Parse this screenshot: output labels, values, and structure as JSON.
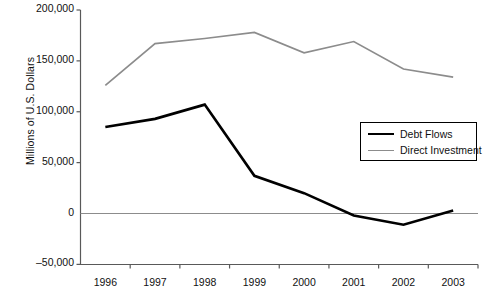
{
  "chart_data": {
    "type": "line",
    "title": "",
    "xlabel": "",
    "ylabel": "Millions of U.S. Dollars",
    "categories": [
      "1996",
      "1997",
      "1998",
      "1999",
      "2000",
      "2001",
      "2002",
      "2003"
    ],
    "ylim": [
      -50000,
      200000
    ],
    "yticks": [
      -50000,
      0,
      50000,
      100000,
      150000,
      200000
    ],
    "ytick_labels": [
      "–50,000",
      "0",
      "50,000",
      "100,000",
      "150,000",
      "200,000"
    ],
    "grid": false,
    "legend_position": "center-right",
    "series": [
      {
        "name": "Debt Flows",
        "color": "#000000",
        "width": 2.6,
        "values": [
          85000,
          93000,
          107000,
          37000,
          20000,
          -2000,
          -11000,
          3000
        ]
      },
      {
        "name": "Direct Investment",
        "color": "#8c8c8c",
        "width": 1.7,
        "values": [
          126000,
          167000,
          172000,
          178000,
          158000,
          169000,
          142000,
          134000
        ]
      }
    ]
  },
  "legend": {
    "items": [
      {
        "label": "Debt Flows"
      },
      {
        "label": "Direct Investment"
      }
    ]
  }
}
